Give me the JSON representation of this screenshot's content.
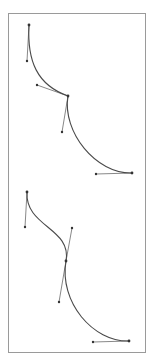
{
  "diagram": {
    "frame": {
      "x1": 8,
      "y1": 13,
      "x2": 145,
      "y2": 352,
      "stroke": "#9a9a9a"
    },
    "colors": {
      "curve": "#4a4a4a",
      "handle": "#6a6a6a",
      "point": "#333333"
    },
    "curves": [
      {
        "name": "curve-top",
        "segments": [
          {
            "p0": [
              29,
              25
            ],
            "c1": [
              27,
              61
            ],
            "c2": [
              37,
              85
            ],
            "p1": [
              68,
              96
            ]
          },
          {
            "p0": [
              68,
              96
            ],
            "c1": [
              62,
              132
            ],
            "c2": [
              96,
              174
            ],
            "p1": [
              132,
              173
            ]
          }
        ],
        "handles": [
          {
            "anchor": [
              29,
              25
            ],
            "handle": [
              27,
              61
            ]
          },
          {
            "anchor": [
              68,
              96
            ],
            "handle": [
              37,
              85
            ]
          },
          {
            "anchor": [
              68,
              96
            ],
            "handle": [
              62,
              132
            ]
          },
          {
            "anchor": [
              132,
              173
            ],
            "handle": [
              96,
              174
            ]
          }
        ]
      },
      {
        "name": "curve-bottom",
        "segments": [
          {
            "p0": [
              27,
              192
            ],
            "c1": [
              25,
              227
            ],
            "c2": [
              72,
              228
            ],
            "p1": [
              66,
              261
            ]
          },
          {
            "p0": [
              66,
              261
            ],
            "c1": [
              59,
              302
            ],
            "c2": [
              93,
              342
            ],
            "p1": [
              129,
              341
            ]
          }
        ],
        "handles": [
          {
            "anchor": [
              27,
              192
            ],
            "handle": [
              25,
              227
            ]
          },
          {
            "anchor": [
              66,
              261
            ],
            "handle": [
              72,
              228
            ]
          },
          {
            "anchor": [
              66,
              261
            ],
            "handle": [
              59,
              302
            ]
          },
          {
            "anchor": [
              129,
              341
            ],
            "handle": [
              93,
              342
            ]
          }
        ]
      }
    ]
  }
}
